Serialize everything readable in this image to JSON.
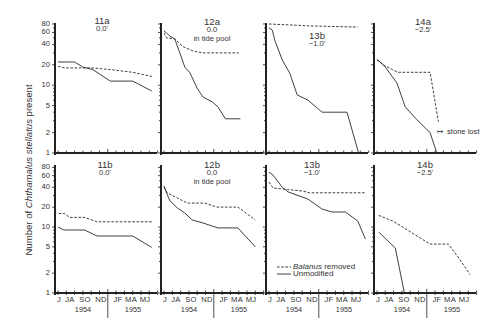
{
  "chart_data": {
    "type": "line",
    "title": "",
    "xlabel": "",
    "ylabel": "Number of Chthamalus stellatus present",
    "ylabel_parts": {
      "prefix": "Number of ",
      "species": "Chthamalus stellatus",
      "suffix": " present"
    },
    "yscale": "log",
    "ylim": [
      1,
      80
    ],
    "yticks": [
      1,
      2,
      5,
      10,
      20,
      40,
      60,
      80
    ],
    "ytick_labels": [
      "1",
      "2",
      "5",
      "10",
      "20",
      "40",
      "60",
      "80"
    ],
    "xticks": [
      "J",
      "JA",
      "SO",
      "ND",
      "JF",
      "MA",
      "MJ"
    ],
    "years": [
      "1954",
      "1955"
    ],
    "grid": false,
    "legend": {
      "position": "inside bottom-row panel 13b, lower left",
      "entries": [
        {
          "label_italic": "Balanus",
          "label_rest": " removed",
          "style": "dashed"
        },
        {
          "label_italic": "",
          "label_rest": "Unmodified",
          "style": "solid"
        }
      ]
    },
    "annotations": [
      {
        "panel": "14a",
        "arrow": "↦",
        "text": "stone lost"
      }
    ],
    "panels": [
      {
        "id": "11a",
        "elevation": "0.0'",
        "note": "",
        "row": 0,
        "col": 0,
        "series": [
          {
            "name": "Balanus removed",
            "style": "dashed",
            "x": [
              0,
              0.8,
              4.2,
              6.3,
              9.0,
              11.3
            ],
            "y": [
              19,
              18,
              18,
              17,
              15.5,
              13.5
            ]
          },
          {
            "name": "Unmodified",
            "style": "solid",
            "x": [
              0,
              2.0,
              3.0,
              4.2,
              6.3,
              9.0,
              11.3
            ],
            "y": [
              22,
              22,
              18.5,
              17,
              11.5,
              11.5,
              8.2
            ]
          }
        ]
      },
      {
        "id": "12a",
        "elevation": "0.0",
        "note": "in tide pool",
        "row": 0,
        "col": 1,
        "series": [
          {
            "name": "Balanus removed",
            "style": "dashed",
            "x": [
              0,
              0.3,
              1.3,
              2.3,
              3.5,
              4.7,
              6.4,
              9.0
            ],
            "y": [
              59,
              50,
              48,
              37,
              32,
              30,
              30,
              30
            ]
          },
          {
            "name": "Unmodified",
            "style": "solid",
            "x": [
              0,
              0.3,
              0.7,
              1.3,
              1.9,
              2.5,
              3.1,
              4.0,
              4.7,
              5.8,
              6.5,
              7.4,
              9.2
            ],
            "y": [
              63,
              59,
              53,
              48,
              30,
              18.5,
              15.5,
              9,
              6.7,
              5.7,
              4.8,
              3.2,
              3.2
            ]
          }
        ]
      },
      {
        "id": "13b",
        "elevation": "−1.0'",
        "note": "",
        "row": 0,
        "col": 2,
        "series": [
          {
            "name": "Balanus removed",
            "style": "dashed",
            "x": [
              0,
              2.9,
              4.9,
              10.7
            ],
            "y": [
              80,
              77,
              75,
              72
            ]
          },
          {
            "name": "Unmodified",
            "style": "solid",
            "x": [
              0,
              0.4,
              0.7,
              1.6,
              2.5,
              3.4,
              4.7,
              6.4,
              9.4,
              10.8
            ],
            "y": [
              70,
              65,
              46,
              23.5,
              15,
              7.2,
              6,
              4,
              4,
              1
            ]
          }
        ]
      },
      {
        "id": "14a",
        "elevation": "−2.5'",
        "note": "",
        "row": 0,
        "col": 3,
        "series": [
          {
            "name": "Balanus removed",
            "style": "dashed",
            "x": [
              0,
              0.7,
              2.5,
              6.4,
              7.4
            ],
            "y": [
              24,
              20,
              15.5,
              15.5,
              2.9
            ]
          },
          {
            "name": "Unmodified",
            "style": "solid",
            "x": [
              0,
              0.4,
              1.0,
              2.4,
              3.4,
              4.8,
              6.4,
              7.2
            ],
            "y": [
              23.5,
              22,
              18.5,
              10.8,
              4.8,
              3.1,
              2.0,
              1.0
            ]
          }
        ]
      },
      {
        "id": "11b",
        "elevation": "0.0'",
        "note": "",
        "row": 1,
        "col": 0,
        "series": [
          {
            "name": "Balanus removed",
            "style": "dashed",
            "x": [
              0.1,
              0.8,
              1.4,
              3.2,
              4.7,
              11.3
            ],
            "y": [
              16,
              16,
              14,
              14,
              12,
              12
            ]
          },
          {
            "name": "Unmodified",
            "style": "solid",
            "x": [
              0,
              0.7,
              3.2,
              4.7,
              9.0,
              11.3
            ],
            "y": [
              10,
              9,
              9,
              7.3,
              7.3,
              4.9
            ]
          }
        ]
      },
      {
        "id": "12b",
        "elevation": "0.0",
        "note": "in tide pool",
        "row": 1,
        "col": 1,
        "series": [
          {
            "name": "Balanus removed",
            "style": "dashed",
            "x": [
              0,
              0.4,
              1.6,
              2.8,
              4.9,
              6.4,
              8.9,
              11.0
            ],
            "y": [
              40,
              33,
              27.5,
              23,
              23,
              20,
              20,
              12.8
            ]
          },
          {
            "name": "Unmodified",
            "style": "solid",
            "x": [
              0,
              0.3,
              0.7,
              1.6,
              2.5,
              3.4,
              4.7,
              6.5,
              8.9,
              11.0
            ],
            "y": [
              42,
              33,
              25,
              19.5,
              16.3,
              12.8,
              11.5,
              9.7,
              9.7,
              5.0
            ]
          }
        ]
      },
      {
        "id": "13b",
        "elevation": "−1.0'",
        "note": "",
        "row": 1,
        "col": 2,
        "series": [
          {
            "name": "Balanus removed",
            "style": "dashed",
            "x": [
              0,
              0.5,
              2.2,
              4.1,
              4.9,
              11.6
            ],
            "y": [
              48,
              39,
              37,
              35,
              33,
              33
            ]
          },
          {
            "name": "Unmodified",
            "style": "solid",
            "x": [
              0,
              0.5,
              1.6,
              2.3,
              4.7,
              6.4,
              7.6,
              9.2,
              10.7,
              11.6
            ],
            "y": [
              68,
              61,
              40,
              34,
              26.5,
              18.7,
              16.9,
              16.9,
              12.3,
              6.6
            ]
          }
        ]
      },
      {
        "id": "14b",
        "elevation": "−2.5'",
        "note": "",
        "row": 1,
        "col": 3,
        "series": [
          {
            "name": "Balanus removed",
            "style": "dashed",
            "x": [
              0.2,
              1.9,
              3.1,
              4.6,
              6.4,
              8.6,
              10.0,
              11.2
            ],
            "y": [
              15,
              12.3,
              10,
              7.6,
              5.5,
              5.5,
              3.2,
              1.9
            ]
          },
          {
            "name": "Unmodified",
            "style": "solid",
            "x": [
              0.2,
              2.2,
              3.3
            ],
            "y": [
              8.4,
              4.8,
              1.0
            ]
          }
        ]
      }
    ]
  }
}
